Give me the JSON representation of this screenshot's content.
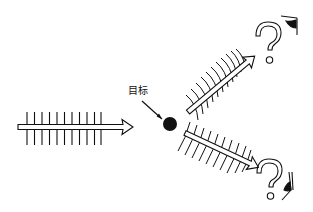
{
  "diagram": {
    "title": "",
    "target_label": "目标",
    "colors": {
      "ink": "#111111",
      "background": "#ffffff"
    },
    "elements": {
      "incident_wave": {
        "description": "incoming wave arrow with vertical wavefront lines",
        "direction": "left-to-right",
        "wavefront_count": 11
      },
      "target": {
        "description": "solid black dot",
        "shape": "circle"
      },
      "scattered_wave_upper": {
        "description": "scattered wave arrow heading up-right with curved wavefronts",
        "wavefront_count": 11
      },
      "scattered_wave_lower": {
        "description": "scattered wave arrow heading down-right with curved wavefronts",
        "wavefront_count": 10
      },
      "observer_upper": {
        "symbol": "?",
        "icon": "eye-icon"
      },
      "observer_lower": {
        "symbol": "?",
        "icon": "eye-icon"
      }
    }
  }
}
